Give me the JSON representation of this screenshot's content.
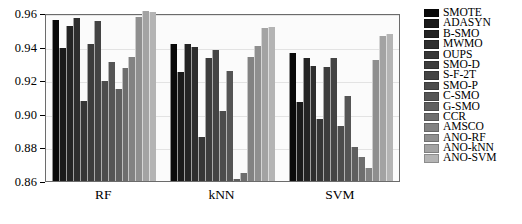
{
  "chart_data": {
    "type": "bar",
    "title": "",
    "xlabel": "",
    "ylabel": "",
    "categories": [
      "RF",
      "kNN",
      "SVM"
    ],
    "ylim": [
      0.86,
      0.96
    ],
    "yticks": [
      0.86,
      0.88,
      0.9,
      0.92,
      0.94,
      0.96
    ],
    "ytick_labels": [
      "0.86",
      "0.88",
      "0.90",
      "0.92",
      "0.94",
      "0.96"
    ],
    "grid": true,
    "legend_position": "right",
    "series": [
      {
        "name": "SMOTE",
        "color": "#0a0a0a",
        "values": [
          0.956,
          0.9415,
          0.9363
        ]
      },
      {
        "name": "ADASYN",
        "color": "#1a1a1a",
        "values": [
          0.9392,
          0.9247,
          0.9072
        ]
      },
      {
        "name": "B-SMO",
        "color": "#242424",
        "values": [
          0.9523,
          0.9418,
          0.9331
        ]
      },
      {
        "name": "MWMO",
        "color": "#2e2e2e",
        "values": [
          0.9571,
          0.9398,
          0.9287
        ]
      },
      {
        "name": "OUPS",
        "color": "#363636",
        "values": [
          0.9076,
          0.8862,
          0.8972
        ]
      },
      {
        "name": "SMO-D",
        "color": "#3d3d3d",
        "values": [
          0.9418,
          0.9334,
          0.9279
        ]
      },
      {
        "name": "S-F-2T",
        "color": "#444444",
        "values": [
          0.9551,
          0.9378,
          0.9333
        ]
      },
      {
        "name": "SMO-P",
        "color": "#4c4c4c",
        "values": [
          0.9198,
          0.9014,
          0.893
        ]
      },
      {
        "name": "C-SMO",
        "color": "#555555",
        "values": [
          0.931,
          0.9257,
          0.9104
        ]
      },
      {
        "name": "G-SMO",
        "color": "#5f5f5f",
        "values": [
          0.9146,
          0.861,
          0.88
        ]
      },
      {
        "name": "CCR",
        "color": "#6e6e6e",
        "values": [
          0.9272,
          0.8649,
          0.8743
        ]
      },
      {
        "name": "AMSCO",
        "color": "#828282",
        "values": [
          0.9337,
          0.934,
          0.868
        ]
      },
      {
        "name": "ANO-RF",
        "color": "#8f8f8f",
        "values": [
          0.9578,
          0.9404,
          0.9318
        ]
      },
      {
        "name": "ANO-kNN",
        "color": "#a3a3a3",
        "values": [
          0.9613,
          0.9508,
          0.9462
        ]
      },
      {
        "name": "ANO-SVM",
        "color": "#b4b4b4",
        "values": [
          0.9606,
          0.9518,
          0.9478
        ]
      }
    ]
  }
}
